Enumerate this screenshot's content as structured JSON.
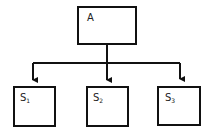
{
  "diagram": {
    "type": "hierarchy",
    "root": {
      "id": "A",
      "label": "A"
    },
    "children": [
      {
        "id": "S1",
        "base": "S",
        "sub": "1"
      },
      {
        "id": "S2",
        "base": "S",
        "sub": "2"
      },
      {
        "id": "S3",
        "base": "S",
        "sub": "3"
      }
    ],
    "edges": [
      {
        "from": "A",
        "to": "S1"
      },
      {
        "from": "A",
        "to": "S2"
      },
      {
        "from": "A",
        "to": "S3"
      }
    ],
    "line_color": "#111111",
    "background": "#ffffff"
  }
}
